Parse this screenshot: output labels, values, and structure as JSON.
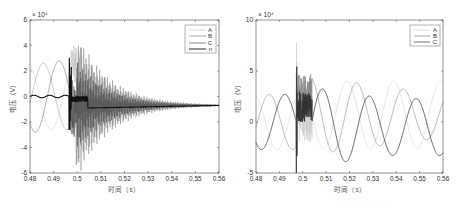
{
  "chart_data": [
    {
      "type": "line",
      "title": "",
      "xlabel": "时间（s）",
      "ylabel": "电压（V）",
      "y_exponent": "×10^4",
      "xlim": [
        0.48,
        0.56
      ],
      "ylim": [
        -6,
        6
      ],
      "x_ticks": [
        "0.48",
        "0.49",
        "0.5",
        "0.51",
        "0.52",
        "0.53",
        "0.54",
        "0.55",
        "0.56"
      ],
      "y_ticks": [
        "-6",
        "-4",
        "-2",
        "0",
        "2",
        "4",
        "6"
      ],
      "legend": [
        "A",
        "B",
        "C",
        "n"
      ],
      "legend_position": "upper right",
      "grid": false,
      "series": [
        {
          "name": "A",
          "color": "#c8c8c8",
          "description": "50Hz sinusoid amplitude ~2.6e4 until fault at ~0.497s, then high-frequency decaying oscillation up to ~5e4, settling to ~-0.7e4 by 0.56s"
        },
        {
          "name": "B",
          "color": "#8a8a8a",
          "description": "50Hz sinusoid amplitude ~2.6e4 until fault, then decaying high-frequency oscillation down to ~-7e4, settling to ~-0.7e4"
        },
        {
          "name": "C",
          "color": "#555555",
          "description": "50Hz sinusoid amplitude ~2.8e4 until fault, then decaying high-frequency oscillation, settling to ~-0.7e4"
        },
        {
          "name": "n",
          "color": "#111111",
          "description": "near 0 until ~0.497s, spike to about -4.8e4, then ~-1e4 trending to ~-0.7e4"
        }
      ]
    },
    {
      "type": "line",
      "title": "",
      "xlabel": "时间（s）",
      "ylabel": "电压（V）",
      "y_exponent": "×10^4",
      "xlim": [
        0.48,
        0.56
      ],
      "ylim": [
        -5,
        10
      ],
      "x_ticks": [
        "0.48",
        "0.49",
        "0.5",
        "0.51",
        "0.52",
        "0.53",
        "0.54",
        "0.55",
        "0.56"
      ],
      "y_ticks": [
        "-5",
        "0",
        "5",
        "10"
      ],
      "legend": [
        "A",
        "B",
        "C"
      ],
      "legend_position": "upper right",
      "grid": false,
      "series": [
        {
          "name": "A",
          "color": "#c8c8c8",
          "description": "50Hz sinusoid ~2.7e4 amplitude; spike to ~9e4 at ~0.497s, then sinusoid with offset around 1e4 (peaks ~4e4, troughs ~-2.7e4)"
        },
        {
          "name": "B",
          "color": "#8a8a8a",
          "description": "50Hz sinusoid ~2.7e4; transient ringing 0.5-0.504s, then sinusoid peaking ~3.8e4 decreasing to ~2.3e4"
        },
        {
          "name": "C",
          "color": "#333333",
          "description": "50Hz sinusoid ~2.7e4; spike ~6e4/-4.5e4 at fault, then sinusoid peaks ~4e4 at 0.506s decreasing to ~2.3e4, troughs ~-3.3e4"
        }
      ]
    }
  ],
  "left": {
    "exponent": "× 10⁴",
    "xlabel": "时间（s）",
    "ylabel": "电压（V）",
    "x_ticks": [
      "0.48",
      "0.49",
      "0.5",
      "0.51",
      "0.52",
      "0.53",
      "0.54",
      "0.55",
      "0.56"
    ],
    "y_ticks": [
      "6",
      "4",
      "2",
      "0",
      "-2",
      "-4",
      "-6"
    ],
    "legend": [
      "A",
      "B",
      "C",
      "n"
    ]
  },
  "right": {
    "exponent": "× 10⁴",
    "xlabel": "时间（s）",
    "ylabel": "电压（V）",
    "x_ticks": [
      "0.48",
      "0.49",
      "0.5",
      "0.51",
      "0.52",
      "0.53",
      "0.54",
      "0.55",
      "0.56"
    ],
    "y_ticks": [
      "10",
      "5",
      "0",
      "-5"
    ],
    "legend": [
      "A",
      "B",
      "C"
    ]
  },
  "caption": "· · · · · · · ·"
}
